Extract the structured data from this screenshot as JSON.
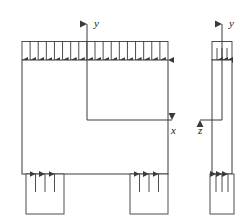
{
  "figure": {
    "type": "engineering-free-body-diagram",
    "stroke_color": "#3a3a3a",
    "fill_color": "#ffffff",
    "line_width": 0.9
  },
  "labels": {
    "y_front": "y",
    "x_front": "x",
    "y_side": "y",
    "z_side": "z"
  },
  "front_view": {
    "name": "front-view",
    "body": {
      "x": 22,
      "y": 60,
      "width": 146,
      "height": 114
    },
    "distributed_load": {
      "name": "distributed-load-top",
      "direction": "down",
      "arrow_count": 19,
      "band_top": 41,
      "band_bottom": 60,
      "x_start": 22,
      "x_end": 168
    },
    "supports": [
      {
        "name": "support-left",
        "x": 26,
        "y": 174,
        "width": 38,
        "height": 40,
        "arrow_count": 3,
        "direction": "up"
      },
      {
        "name": "support-right",
        "x": 130,
        "y": 174,
        "width": 38,
        "height": 40,
        "arrow_count": 3,
        "direction": "up"
      }
    ],
    "axes": {
      "origin_x": 87,
      "origin_y": 120,
      "y_axis_tip_y": 18,
      "x_axis_tip_x": 178,
      "y_label_pos": {
        "x": 93,
        "y": 24
      },
      "x_label_pos": {
        "x": 172,
        "y": 133
      }
    }
  },
  "side_view": {
    "name": "side-view",
    "body": {
      "x": 212,
      "y": 60,
      "width": 20,
      "height": 114
    },
    "distributed_load": {
      "name": "distributed-load-top-side",
      "direction": "down",
      "arrow_count": 3,
      "band_top": 41,
      "band_bottom": 60
    },
    "support": {
      "name": "support-side",
      "x": 210,
      "y": 174,
      "width": 24,
      "height": 40,
      "arrow_count": 3,
      "direction": "up"
    },
    "axes": {
      "origin_x": 222,
      "origin_y": 120,
      "y_axis_tip_y": 18,
      "z_axis_tip_x": 196,
      "y_label_pos": {
        "x": 228,
        "y": 24
      },
      "z_label_pos": {
        "x": 200,
        "y": 133
      }
    }
  }
}
